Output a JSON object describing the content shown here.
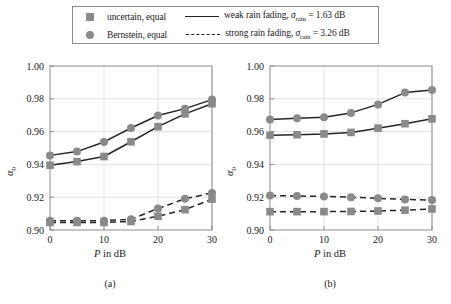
{
  "legend": {
    "entries": [
      {
        "marker": "square-marker",
        "label": "uncertain, equal"
      },
      {
        "marker": "circle-marker",
        "label": "Bernstein, equal"
      }
    ],
    "line_entries": [
      {
        "style": "solid-line",
        "label_pre": "weak rain fading, ",
        "sigma": "σ",
        "sigma_sub": "rain",
        "label_post": " = 1.63 dB"
      },
      {
        "style": "dashed-line",
        "label_pre": "strong rain fading, ",
        "sigma": "σ",
        "sigma_sub": "rain",
        "label_post": " = 3.26 dB"
      }
    ],
    "marker_color": "#8a8a8a",
    "line_color": "#222222"
  },
  "chart_data": [
    {
      "type": "line",
      "panel_label": "(a)",
      "title": "",
      "xlabel_italic": "P",
      "xlabel_rest": " in dB",
      "ylabel": "α",
      "ylabel_sub": "0",
      "x": [
        0,
        5,
        10,
        15,
        20,
        25,
        30
      ],
      "xlim": [
        0,
        30
      ],
      "ylim": [
        0.9,
        1.0
      ],
      "xticks": [
        0,
        10,
        20,
        30
      ],
      "xticklabels": [
        "0",
        "10",
        "20",
        "30"
      ],
      "yticks": [
        0.9,
        0.92,
        0.94,
        0.96,
        0.98,
        1.0
      ],
      "yticklabels": [
        "0.90",
        "0.92",
        "0.94",
        "0.96",
        "0.98",
        "1.00"
      ],
      "grid": true,
      "legend_position": "above-figure",
      "series": [
        {
          "name": "Bernstein, equal — weak rain fading",
          "marker": "circle",
          "linestyle": "solid",
          "values": [
            0.9455,
            0.9478,
            0.9537,
            0.9622,
            0.9698,
            0.974,
            0.9795
          ]
        },
        {
          "name": "uncertain, equal — weak rain fading",
          "marker": "square",
          "linestyle": "solid",
          "values": [
            0.9395,
            0.9417,
            0.9448,
            0.9538,
            0.963,
            0.9708,
            0.977
          ]
        },
        {
          "name": "Bernstein, equal — strong rain fading",
          "marker": "circle",
          "linestyle": "dashed",
          "values": [
            0.9057,
            0.9056,
            0.9057,
            0.9065,
            0.9131,
            0.919,
            0.9226
          ]
        },
        {
          "name": "uncertain, equal — strong rain fading",
          "marker": "square",
          "linestyle": "dashed",
          "values": [
            0.9046,
            0.9046,
            0.9046,
            0.9052,
            0.9084,
            0.9124,
            0.9188
          ]
        }
      ]
    },
    {
      "type": "line",
      "panel_label": "(b)",
      "title": "",
      "xlabel_italic": "P",
      "xlabel_rest": " in dB",
      "ylabel": "α",
      "ylabel_sub": "0",
      "x": [
        0,
        5,
        10,
        15,
        20,
        25,
        30
      ],
      "xlim": [
        0,
        30
      ],
      "ylim": [
        0.9,
        1.0
      ],
      "xticks": [
        0,
        10,
        20,
        30
      ],
      "xticklabels": [
        "0",
        "10",
        "20",
        "30"
      ],
      "yticks": [
        0.9,
        0.92,
        0.94,
        0.96,
        0.98,
        1.0
      ],
      "yticklabels": [
        "0.90",
        "0.92",
        "0.94",
        "0.96",
        "0.98",
        "1.00"
      ],
      "grid": true,
      "legend_position": "above-figure",
      "series": [
        {
          "name": "Bernstein, equal — weak rain fading",
          "marker": "circle",
          "linestyle": "solid",
          "values": [
            0.9674,
            0.9681,
            0.9688,
            0.9714,
            0.9766,
            0.9838,
            0.9853
          ]
        },
        {
          "name": "uncertain, equal — weak rain fading",
          "marker": "square",
          "linestyle": "solid",
          "values": [
            0.9578,
            0.9581,
            0.9586,
            0.9595,
            0.9621,
            0.9648,
            0.9678
          ]
        },
        {
          "name": "Bernstein, equal — strong rain fading",
          "marker": "circle",
          "linestyle": "dashed",
          "values": [
            0.921,
            0.9207,
            0.9205,
            0.92,
            0.9193,
            0.9186,
            0.9183
          ]
        },
        {
          "name": "uncertain, equal — strong rain fading",
          "marker": "square",
          "linestyle": "dashed",
          "values": [
            0.9112,
            0.9112,
            0.9112,
            0.9113,
            0.9116,
            0.9121,
            0.9128
          ]
        }
      ]
    }
  ],
  "style": {
    "marker_color": "#8a8a8a",
    "line_color": "#262626",
    "axis_color": "#8c8c8c",
    "grid_color": "#d4d4d4",
    "background": "#ffffff"
  }
}
